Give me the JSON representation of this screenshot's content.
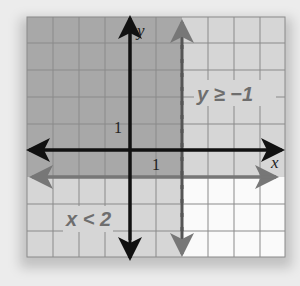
{
  "graph": {
    "axes": {
      "x_label": "x",
      "y_label": "y",
      "x_tick_label": "1",
      "y_tick_label": "1"
    },
    "inequalities": [
      {
        "label": "y ≥ −1",
        "boundary": "y = -1",
        "line_style": "solid",
        "shaded": "above"
      },
      {
        "label": "x < 2",
        "boundary": "x = 2",
        "line_style": "dashed",
        "shaded": "left"
      }
    ],
    "grid": {
      "x_range": [
        -4,
        6
      ],
      "y_range": [
        -4,
        5
      ]
    },
    "colors": {
      "overlap_region": "#a8a8a8",
      "single_region": "#d6d6d6",
      "unshaded_region": "#fafafa",
      "axis": "#111111",
      "boundary": "#777777",
      "grid_line": "#8a8a8a",
      "label_text": "#6e6e6e"
    }
  }
}
